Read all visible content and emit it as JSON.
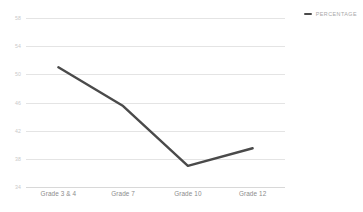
{
  "chart_data": {
    "type": "line",
    "title": "",
    "subtitle": "",
    "xlabel": "",
    "ylabel": "",
    "categories": [
      "Grade 3 & 4",
      "Grade 7",
      "Grade 10",
      "Grade 12"
    ],
    "series": [
      {
        "name": "PERCENTAGE",
        "values": [
          51.0,
          45.5,
          37.0,
          39.5
        ],
        "color": "#4a4a4a"
      }
    ],
    "ylim": [
      34,
      58
    ],
    "yticks": [
      58,
      54,
      50,
      46,
      42,
      38,
      34
    ],
    "ytick_labels": [
      "58",
      "54",
      "50",
      "46",
      "42",
      "38",
      "34"
    ],
    "grid": true,
    "grid_color": "#e4e4e4",
    "legend": {
      "position": "top-right",
      "entries": [
        {
          "label": "PERCENTAGE",
          "color": "#4a4a4a",
          "marker": "line-swatch"
        }
      ]
    },
    "background_color": "#ffffff",
    "axis_label_color": "#8c8c8c",
    "tick_label_color": "#c9c9c9"
  }
}
